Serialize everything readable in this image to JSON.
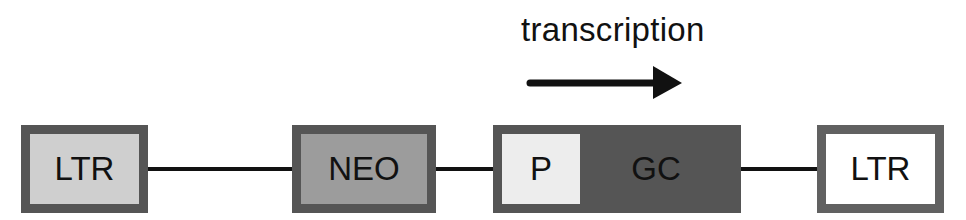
{
  "diagram": {
    "annotation": {
      "label": "transcription",
      "arrow_direction": "right"
    },
    "elements": [
      {
        "id": "ltr-left",
        "label": "LTR",
        "fill": "#cfcfcf"
      },
      {
        "id": "neo",
        "label": "NEO",
        "fill": "#9c9c9c"
      },
      {
        "id": "promoter",
        "label": "P",
        "fill": "#ededed"
      },
      {
        "id": "gc",
        "label": "GC",
        "fill": "#555555"
      },
      {
        "id": "ltr-right",
        "label": "LTR",
        "fill": "#ffffff"
      }
    ],
    "border_color": "#555555",
    "connections": [
      [
        "ltr-left",
        "neo"
      ],
      [
        "neo",
        "promoter"
      ],
      [
        "gc",
        "ltr-right"
      ]
    ]
  }
}
